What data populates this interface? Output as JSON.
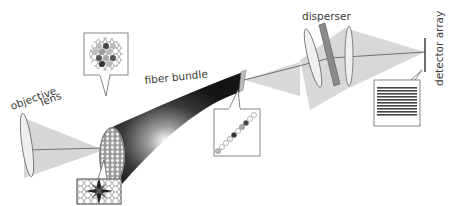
{
  "labels": {
    "objective_lens_line1": "objective",
    "objective_lens_line2": "lens",
    "fiber_bundle": "fiber bundle",
    "disperser": "disperser",
    "detector_array": "detector array"
  },
  "components": [
    {
      "name": "objective-lens",
      "label": "objective lens"
    },
    {
      "name": "fiber-bundle",
      "label": "fiber bundle"
    },
    {
      "name": "collimating-lens",
      "label": ""
    },
    {
      "name": "disperser",
      "label": "disperser"
    },
    {
      "name": "focusing-lens",
      "label": ""
    },
    {
      "name": "detector-array",
      "label": "detector array"
    }
  ],
  "insets": [
    {
      "name": "input-face-mask-inset",
      "description": "hexagonal fiber array with cross/star pattern of dark fibers"
    },
    {
      "name": "input-face-sparse-inset",
      "description": "hexagonal fiber array with scattered dark and gray fibers"
    },
    {
      "name": "output-slit-inset",
      "description": "fibers rearranged into a diagonal line"
    },
    {
      "name": "detector-spectra-inset",
      "description": "stacked horizontal spectral stripes"
    }
  ],
  "colors": {
    "beam": "#d4d4d4",
    "line": "#555555",
    "bundle_dark": "#222222",
    "bundle_light": "#f4f4f4",
    "disperser": "#8a8a8a",
    "lens_fill": "#eeeeee"
  }
}
